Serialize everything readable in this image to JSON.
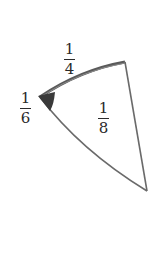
{
  "diagram": {
    "type": "sector",
    "colors": {
      "outline": "#6a6a6a",
      "arc_highlight": "#4a4a4a",
      "angle_marker": "#3a3a3a",
      "background": "#ffffff"
    },
    "vertices": {
      "apex": [
        40,
        97
      ],
      "top": [
        125,
        62
      ],
      "bottom": [
        147,
        191
      ]
    },
    "labels": {
      "arc": {
        "num": "1",
        "den": "4"
      },
      "angle": {
        "num": "1",
        "den": "6"
      },
      "area": {
        "num": "1",
        "den": "8"
      }
    }
  }
}
